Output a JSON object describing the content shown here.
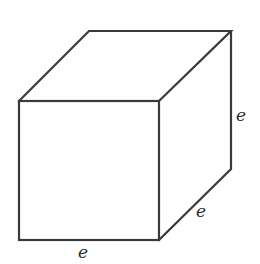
{
  "diagram": {
    "type": "cube",
    "colors": {
      "background": "#ffffff",
      "stroke": "#3a3a3a",
      "label": "#2a2a2a"
    },
    "vertices": {
      "front_top_left": [
        19,
        101
      ],
      "front_top_right": [
        159,
        101
      ],
      "front_bottom_left": [
        19,
        240
      ],
      "front_bottom_right": [
        159,
        240
      ],
      "back_top_left": [
        89,
        31
      ],
      "back_top_right": [
        231,
        31
      ],
      "back_bottom_right": [
        231,
        169
      ]
    },
    "labels": {
      "bottom_edge": "e",
      "depth_edge": "e",
      "height_edge": "e"
    }
  }
}
